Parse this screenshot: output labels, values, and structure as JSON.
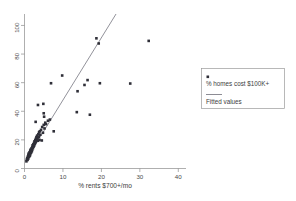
{
  "chart_data": {
    "type": "scatter",
    "title": "",
    "xlabel": "% rents $700+/mo",
    "ylabel": "",
    "xlim": [
      0,
      42
    ],
    "ylim": [
      0,
      108
    ],
    "xticks": [
      0,
      10,
      20,
      30,
      40
    ],
    "yticks": [
      0,
      20,
      40,
      60,
      80,
      100
    ],
    "xtick_labels": [
      "0",
      "10",
      "20",
      "30",
      "40"
    ],
    "ytick_labels": [
      "0",
      "20",
      "40",
      "60",
      "80",
      "100"
    ],
    "grid": false,
    "legend_position": "right-outside",
    "marker_color": "#2f2f38",
    "line_color": "#6e6e78",
    "axis_color": "#8c8c8c",
    "series": [
      {
        "name": "% homes cost $100K+",
        "type": "scatter",
        "points": [
          [
            0.5,
            5.0
          ],
          [
            0.6,
            6.2
          ],
          [
            0.7,
            7.4
          ],
          [
            0.8,
            6.0
          ],
          [
            0.9,
            8.5
          ],
          [
            1.0,
            7.0
          ],
          [
            1.0,
            9.6
          ],
          [
            1.1,
            10.5
          ],
          [
            1.2,
            8.2
          ],
          [
            1.3,
            11.4
          ],
          [
            1.4,
            9.0
          ],
          [
            1.5,
            12.5
          ],
          [
            1.5,
            10.0
          ],
          [
            1.6,
            13.2
          ],
          [
            1.7,
            11.0
          ],
          [
            1.8,
            14.0
          ],
          [
            1.9,
            12.0
          ],
          [
            2.0,
            15.0
          ],
          [
            2.0,
            13.0
          ],
          [
            2.1,
            16.2
          ],
          [
            2.2,
            14.2
          ],
          [
            2.3,
            17.0
          ],
          [
            2.4,
            15.4
          ],
          [
            2.5,
            18.0
          ],
          [
            2.5,
            16.0
          ],
          [
            2.6,
            19.0
          ],
          [
            2.7,
            17.2
          ],
          [
            2.8,
            20.0
          ],
          [
            2.9,
            18.4
          ],
          [
            3.0,
            21.0
          ],
          [
            3.0,
            19.2
          ],
          [
            3.1,
            22.0
          ],
          [
            3.2,
            20.2
          ],
          [
            3.3,
            23.0
          ],
          [
            3.4,
            21.4
          ],
          [
            3.5,
            19.4
          ],
          [
            3.6,
            24.0
          ],
          [
            3.7,
            22.2
          ],
          [
            3.8,
            25.4
          ],
          [
            3.9,
            20.0
          ],
          [
            4.0,
            26.0
          ],
          [
            4.1,
            23.6
          ],
          [
            4.3,
            27.0
          ],
          [
            4.5,
            19.6
          ],
          [
            4.6,
            29.0
          ],
          [
            4.8,
            25.0
          ],
          [
            5.0,
            30.5
          ],
          [
            5.2,
            28.0
          ],
          [
            5.4,
            32.0
          ],
          [
            5.6,
            31.0
          ],
          [
            2.9,
            32.6
          ],
          [
            3.5,
            44.4
          ],
          [
            4.9,
            45.2
          ],
          [
            5.0,
            38.6
          ],
          [
            5.1,
            36.2
          ],
          [
            6.1,
            33.4
          ],
          [
            6.6,
            34.2
          ],
          [
            6.9,
            59.6
          ],
          [
            7.6,
            26.0
          ],
          [
            9.8,
            65.0
          ],
          [
            13.6,
            39.4
          ],
          [
            13.8,
            54.0
          ],
          [
            15.6,
            58.4
          ],
          [
            16.4,
            61.8
          ],
          [
            17.0,
            37.6
          ],
          [
            18.7,
            91.0
          ],
          [
            19.3,
            87.4
          ],
          [
            19.6,
            59.6
          ],
          [
            27.5,
            59.4
          ],
          [
            32.3,
            89.2
          ]
        ]
      },
      {
        "name": "Fitted values",
        "type": "line",
        "endpoints": [
          [
            0.4,
            6.0
          ],
          [
            23.8,
            108.0
          ]
        ]
      }
    ]
  },
  "legend": {
    "marker_label": "% homes cost $100K+",
    "line_label": "Fitted values"
  },
  "axes": {
    "x_title": "% rents $700+/mo"
  }
}
